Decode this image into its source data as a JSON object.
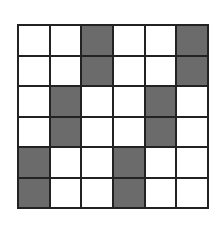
{
  "grid": {
    "rows": 6,
    "cols": 6,
    "fill_color": "#6b6b6b",
    "empty_color": "#ffffff",
    "line_color": "#222222",
    "cells": [
      [
        0,
        0,
        1,
        0,
        0,
        1
      ],
      [
        0,
        0,
        1,
        0,
        0,
        1
      ],
      [
        0,
        1,
        0,
        0,
        1,
        0
      ],
      [
        0,
        1,
        0,
        0,
        1,
        0
      ],
      [
        1,
        0,
        0,
        1,
        0,
        0
      ],
      [
        1,
        0,
        0,
        1,
        0,
        0
      ]
    ]
  }
}
